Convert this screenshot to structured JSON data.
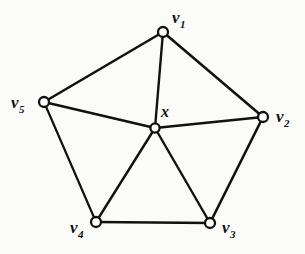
{
  "figure": {
    "kind": "undirected-graph-diagram",
    "background_color": "#fbfbf9",
    "edge_color": "#111111",
    "node_fill_color": "#ffffff",
    "node_stroke_color": "#111111"
  },
  "nodes": [
    {
      "id": "v1",
      "label_base": "v",
      "label_sub": "1",
      "cx": 163,
      "cy": 32,
      "r": 5.0,
      "label_x": 172,
      "label_y": 9
    },
    {
      "id": "v2",
      "label_base": "v",
      "label_sub": "2",
      "cx": 263,
      "cy": 117,
      "r": 5.0,
      "label_x": 276,
      "label_y": 108
    },
    {
      "id": "v3",
      "label_base": "v",
      "label_sub": "3",
      "cx": 210,
      "cy": 223,
      "r": 5.0,
      "label_x": 222,
      "label_y": 219
    },
    {
      "id": "v4",
      "label_base": "v",
      "label_sub": "4",
      "cx": 96,
      "cy": 222,
      "r": 5.0,
      "label_x": 70,
      "label_y": 219
    },
    {
      "id": "v5",
      "label_base": "v",
      "label_sub": "5",
      "cx": 44,
      "cy": 102,
      "r": 5.0,
      "label_x": 11,
      "label_y": 94
    },
    {
      "id": "x",
      "label_base": "x",
      "label_sub": "",
      "cx": 155,
      "cy": 128,
      "r": 4.6,
      "label_x": 161,
      "label_y": 104
    }
  ],
  "edges": [
    {
      "from": "v1",
      "to": "v2",
      "kind": "rim",
      "width": 2.6
    },
    {
      "from": "v2",
      "to": "v3",
      "kind": "rim",
      "width": 2.6
    },
    {
      "from": "v3",
      "to": "v4",
      "kind": "rim",
      "width": 2.6
    },
    {
      "from": "v4",
      "to": "v5",
      "kind": "rim",
      "width": 2.2
    },
    {
      "from": "v5",
      "to": "v1",
      "kind": "rim",
      "width": 2.6
    },
    {
      "from": "x",
      "to": "v1",
      "kind": "spoke",
      "width": 2.4
    },
    {
      "from": "x",
      "to": "v2",
      "kind": "spoke",
      "width": 2.4
    },
    {
      "from": "x",
      "to": "v3",
      "kind": "spoke",
      "width": 2.4
    },
    {
      "from": "x",
      "to": "v4",
      "kind": "spoke",
      "width": 2.4
    },
    {
      "from": "x",
      "to": "v5",
      "kind": "spoke",
      "width": 2.4
    }
  ]
}
